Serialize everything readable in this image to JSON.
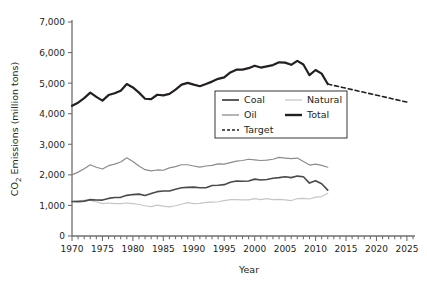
{
  "chart_data": {
    "type": "line",
    "title": "",
    "xlabel": "Year",
    "ylabel": "CO2 Emissions (million tons)",
    "ylabel_display": "CO₂ Emissions (million tons)",
    "xlim": [
      1970,
      2026
    ],
    "ylim": [
      0,
      7000
    ],
    "grid": false,
    "legend_position": "center-right",
    "x_ticks_major": [
      "1970",
      "1975",
      "1980",
      "1985",
      "1990",
      "1995",
      "2000",
      "2005",
      "2010",
      "2015",
      "2020",
      "2025"
    ],
    "x_ticks_major_values": [
      1970,
      1975,
      1980,
      1985,
      1990,
      1995,
      2000,
      2005,
      2010,
      2015,
      2020,
      2025
    ],
    "x_minor_tick_step": 1,
    "y_ticks": [
      "0",
      "1,000",
      "2,000",
      "3,000",
      "4,000",
      "5,000",
      "6,000",
      "7,000"
    ],
    "y_tick_values": [
      0,
      1000,
      2000,
      3000,
      4000,
      5000,
      6000,
      7000
    ],
    "series": [
      {
        "name": "Coal",
        "color": "#4a4a4a",
        "width": 1.6,
        "dash": "none",
        "x": [
          1970,
          1971,
          1972,
          1973,
          1974,
          1975,
          1976,
          1977,
          1978,
          1979,
          1980,
          1981,
          1982,
          1983,
          1984,
          1985,
          1986,
          1987,
          1988,
          1989,
          1990,
          1991,
          1992,
          1993,
          1994,
          1995,
          1996,
          1997,
          1998,
          1999,
          2000,
          2001,
          2002,
          2003,
          2004,
          2005,
          2006,
          2007,
          2008,
          2009,
          2010,
          2011,
          2012
        ],
        "values": [
          1130,
          1125,
          1140,
          1190,
          1180,
          1175,
          1230,
          1260,
          1265,
          1330,
          1355,
          1370,
          1325,
          1390,
          1450,
          1470,
          1470,
          1530,
          1580,
          1590,
          1600,
          1580,
          1580,
          1650,
          1660,
          1680,
          1760,
          1800,
          1790,
          1800,
          1860,
          1830,
          1850,
          1890,
          1910,
          1940,
          1910,
          1960,
          1940,
          1730,
          1810,
          1710,
          1500
        ],
        "last_value": 1500
      },
      {
        "name": "Oil",
        "color": "#8c8c8c",
        "width": 1.2,
        "dash": "none",
        "x": [
          1970,
          1971,
          1972,
          1973,
          1974,
          1975,
          1976,
          1977,
          1978,
          1979,
          1980,
          1981,
          1982,
          1983,
          1984,
          1985,
          1986,
          1987,
          1988,
          1989,
          1990,
          1991,
          1992,
          1993,
          1994,
          1995,
          1996,
          1997,
          1998,
          1999,
          2000,
          2001,
          2002,
          2003,
          2004,
          2005,
          2006,
          2007,
          2008,
          2009,
          2010,
          2011,
          2012
        ],
        "values": [
          2000,
          2090,
          2200,
          2330,
          2250,
          2190,
          2300,
          2350,
          2420,
          2560,
          2440,
          2290,
          2170,
          2130,
          2160,
          2150,
          2230,
          2270,
          2330,
          2330,
          2290,
          2250,
          2290,
          2310,
          2360,
          2350,
          2400,
          2450,
          2470,
          2510,
          2490,
          2470,
          2480,
          2510,
          2570,
          2550,
          2530,
          2550,
          2440,
          2320,
          2350,
          2310,
          2250
        ],
        "last_value": 2250
      },
      {
        "name": "Natural",
        "color": "#c6c6c6",
        "width": 1.2,
        "dash": "none",
        "x": [
          1970,
          1971,
          1972,
          1973,
          1974,
          1975,
          1976,
          1977,
          1978,
          1979,
          1980,
          1981,
          1982,
          1983,
          1984,
          1985,
          1986,
          1987,
          1988,
          1989,
          1990,
          1991,
          1992,
          1993,
          1994,
          1995,
          1996,
          1997,
          1998,
          1999,
          2000,
          2001,
          2002,
          2003,
          2004,
          2005,
          2006,
          2007,
          2008,
          2009,
          2010,
          2011,
          2012
        ],
        "values": [
          1130,
          1150,
          1170,
          1165,
          1120,
          1060,
          1080,
          1060,
          1060,
          1080,
          1060,
          1030,
          990,
          960,
          1010,
          980,
          950,
          990,
          1040,
          1090,
          1060,
          1070,
          1100,
          1110,
          1120,
          1160,
          1190,
          1190,
          1180,
          1180,
          1220,
          1190,
          1220,
          1190,
          1200,
          1180,
          1160,
          1220,
          1230,
          1210,
          1270,
          1290,
          1400
        ],
        "last_value": 1400
      },
      {
        "name": "Total",
        "color": "#231f20",
        "width": 2.2,
        "dash": "none",
        "x": [
          1970,
          1971,
          1972,
          1973,
          1974,
          1975,
          1976,
          1977,
          1978,
          1979,
          1980,
          1981,
          1982,
          1983,
          1984,
          1985,
          1986,
          1987,
          1988,
          1989,
          1990,
          1991,
          1992,
          1993,
          1994,
          1995,
          1996,
          1997,
          1998,
          1999,
          2000,
          2001,
          2002,
          2003,
          2004,
          2005,
          2006,
          2007,
          2008,
          2009,
          2010,
          2011,
          2012
        ],
        "values": [
          4260,
          4360,
          4510,
          4690,
          4550,
          4430,
          4610,
          4670,
          4750,
          4970,
          4860,
          4690,
          4490,
          4480,
          4620,
          4600,
          4650,
          4790,
          4950,
          5010,
          4950,
          4900,
          4970,
          5050,
          5140,
          5190,
          5350,
          5440,
          5440,
          5490,
          5570,
          5510,
          5550,
          5590,
          5680,
          5670,
          5600,
          5730,
          5610,
          5260,
          5430,
          5310,
          4970
        ],
        "last_value": 4970
      },
      {
        "name": "Target",
        "color": "#231f20",
        "width": 1.6,
        "dash": "4,3",
        "x": [
          2012,
          2025
        ],
        "values": [
          4970,
          4380
        ],
        "last_value": 4380
      }
    ],
    "legend": [
      {
        "label": "Coal",
        "color": "#4a4a4a",
        "dash": "none",
        "width": 1.8
      },
      {
        "label": "Natural",
        "color": "#c6c6c6",
        "dash": "none",
        "width": 1.3
      },
      {
        "label": "Oil",
        "color": "#8c8c8c",
        "dash": "none",
        "width": 1.3
      },
      {
        "label": "Total",
        "color": "#231f20",
        "dash": "none",
        "width": 2.4
      },
      {
        "label": "Target",
        "color": "#231f20",
        "dash": "3,2",
        "width": 1.6
      }
    ]
  }
}
